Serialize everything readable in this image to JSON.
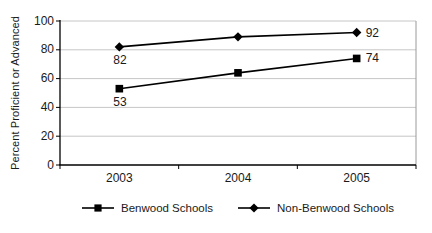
{
  "chart_data": {
    "type": "line",
    "title": "",
    "xlabel": "",
    "ylabel": "Percent Proficient or Advanced",
    "categories": [
      "2003",
      "2004",
      "2005"
    ],
    "ylim": [
      0,
      100
    ],
    "yticks": [
      0,
      20,
      40,
      60,
      80,
      100
    ],
    "grid": true,
    "legend_position": "bottom",
    "series": [
      {
        "name": "Benwood Schools",
        "marker": "square",
        "values": [
          53,
          64,
          74
        ],
        "point_labels": [
          {
            "index": 0,
            "text": "53",
            "placement": "below"
          },
          {
            "index": 2,
            "text": "74",
            "placement": "right"
          }
        ]
      },
      {
        "name": "Non-Benwood Schools",
        "marker": "diamond",
        "values": [
          82,
          89,
          92
        ],
        "point_labels": [
          {
            "index": 0,
            "text": "82",
            "placement": "below"
          },
          {
            "index": 2,
            "text": "92",
            "placement": "right"
          }
        ]
      }
    ]
  },
  "colors": {
    "series": "#000000",
    "grid": "#c6c6c6",
    "plot_border": "#9a9a9a",
    "axis": "#000000",
    "text": "#1a1a1a",
    "background": "#ffffff"
  }
}
